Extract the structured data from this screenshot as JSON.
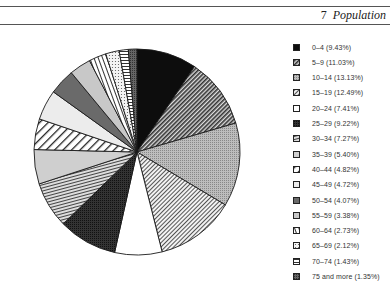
{
  "header": {
    "chapter_number": "7",
    "chapter_title": "Population"
  },
  "chart_data": {
    "type": "pie",
    "title": "",
    "start_angle_deg": 0,
    "direction": "clockwise",
    "categories": [
      "0–4",
      "5–9",
      "10–14",
      "15–19",
      "20–24",
      "25–29",
      "30–34",
      "35–39",
      "40–44",
      "45–49",
      "50–54",
      "55–59",
      "60–64",
      "65–69",
      "70–74",
      "75 and more"
    ],
    "values": [
      9.43,
      11.03,
      13.13,
      12.49,
      7.41,
      9.22,
      7.27,
      5.4,
      4.82,
      4.72,
      4.07,
      3.38,
      2.73,
      2.12,
      1.43,
      1.35
    ],
    "legend_labels": [
      "0–4 (9.43%)",
      "5–9 (11.03%)",
      "10–14 (13.13%)",
      "15–19 (12.49%)",
      "20–24 (7.41%)",
      "25–29 (9.22%)",
      "30–34 (7.27%)",
      "35–39 (5.40%)",
      "40–44 (4.82%)",
      "45–49 (4.72%)",
      "50–54 (4.07%)",
      "55–59 (3.38%)",
      "60–64 (2.73%)",
      "65–69 (2.12%)",
      "70–74 (1.43%)",
      "75 and more (1.35%)"
    ],
    "patterns": [
      "solid-black",
      "dense-diagonal",
      "gray-stipple",
      "fine-diagonal",
      "white",
      "dark-stipple",
      "horizontal-lines",
      "light-gray",
      "wide-diagonal",
      "very-light-gray",
      "dark-gray",
      "light-gray-2",
      "vertical-lines",
      "dotted",
      "horizontal-lines-2",
      "dark-crosshatch"
    ],
    "legend_position": "right"
  }
}
